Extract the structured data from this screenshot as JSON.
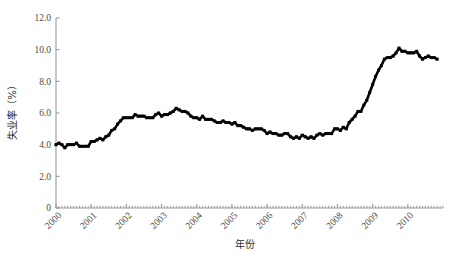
{
  "figure": {
    "background_color": "#ffffff",
    "axis_color": "#9a9a9a",
    "series_color": "#050505"
  },
  "chart_data": {
    "type": "line",
    "title": "",
    "subtitle": "",
    "xlabel": "年份",
    "ylabel": "失业率（%）",
    "ylim": [
      0.0,
      12.0
    ],
    "xlim": [
      2000.0,
      2011.0
    ],
    "yticks": [
      0,
      2.0,
      4.0,
      6.0,
      8.0,
      10.0,
      12.0
    ],
    "ytick_labels": [
      "0",
      "2.0",
      "4.0",
      "6.0",
      "8.0",
      "10.0",
      "12.0"
    ],
    "xticks": [
      2000,
      2001,
      2002,
      2003,
      2004,
      2005,
      2006,
      2007,
      2008,
      2009,
      2010
    ],
    "xtick_labels": [
      "2000",
      "2001",
      "2002",
      "2003",
      "2004",
      "2005",
      "2006",
      "2007",
      "2008",
      "2009",
      "2010"
    ],
    "xtick_label_rotation": 45,
    "minor_ticks": true,
    "minor_tick_interval_months": 1,
    "grid": false,
    "legend": false,
    "legend_position": "none",
    "marker": "filled-square",
    "x_unit": "month",
    "series": [
      {
        "name": "失业率",
        "x": [
          2000.0,
          2000.083,
          2000.167,
          2000.25,
          2000.333,
          2000.417,
          2000.5,
          2000.583,
          2000.667,
          2000.75,
          2000.833,
          2000.917,
          2001.0,
          2001.083,
          2001.167,
          2001.25,
          2001.333,
          2001.417,
          2001.5,
          2001.583,
          2001.667,
          2001.75,
          2001.833,
          2001.917,
          2002.0,
          2002.083,
          2002.167,
          2002.25,
          2002.333,
          2002.417,
          2002.5,
          2002.583,
          2002.667,
          2002.75,
          2002.833,
          2002.917,
          2003.0,
          2003.083,
          2003.167,
          2003.25,
          2003.333,
          2003.417,
          2003.5,
          2003.583,
          2003.667,
          2003.75,
          2003.833,
          2003.917,
          2004.0,
          2004.083,
          2004.167,
          2004.25,
          2004.333,
          2004.417,
          2004.5,
          2004.583,
          2004.667,
          2004.75,
          2004.833,
          2004.917,
          2005.0,
          2005.083,
          2005.167,
          2005.25,
          2005.333,
          2005.417,
          2005.5,
          2005.583,
          2005.667,
          2005.75,
          2005.833,
          2005.917,
          2006.0,
          2006.083,
          2006.167,
          2006.25,
          2006.333,
          2006.417,
          2006.5,
          2006.583,
          2006.667,
          2006.75,
          2006.833,
          2006.917,
          2007.0,
          2007.083,
          2007.167,
          2007.25,
          2007.333,
          2007.417,
          2007.5,
          2007.583,
          2007.667,
          2007.75,
          2007.833,
          2007.917,
          2008.0,
          2008.083,
          2008.167,
          2008.25,
          2008.333,
          2008.417,
          2008.5,
          2008.583,
          2008.667,
          2008.75,
          2008.833,
          2008.917,
          2009.0,
          2009.083,
          2009.167,
          2009.25,
          2009.333,
          2009.417,
          2009.5,
          2009.583,
          2009.667,
          2009.75,
          2009.833,
          2009.917,
          2010.0,
          2010.083,
          2010.167,
          2010.25,
          2010.333,
          2010.417,
          2010.5,
          2010.583,
          2010.667,
          2010.75,
          2010.833
        ],
        "values": [
          4.0,
          4.1,
          4.0,
          3.8,
          4.0,
          4.0,
          4.0,
          4.1,
          3.9,
          3.9,
          3.9,
          3.9,
          4.2,
          4.2,
          4.3,
          4.4,
          4.3,
          4.5,
          4.6,
          4.9,
          5.0,
          5.3,
          5.5,
          5.7,
          5.7,
          5.7,
          5.7,
          5.9,
          5.8,
          5.8,
          5.8,
          5.7,
          5.7,
          5.7,
          5.9,
          6.0,
          5.8,
          5.9,
          5.9,
          6.0,
          6.1,
          6.3,
          6.2,
          6.1,
          6.1,
          6.0,
          5.8,
          5.7,
          5.7,
          5.6,
          5.8,
          5.6,
          5.6,
          5.6,
          5.5,
          5.4,
          5.4,
          5.5,
          5.4,
          5.4,
          5.3,
          5.4,
          5.2,
          5.2,
          5.1,
          5.0,
          5.0,
          4.9,
          5.0,
          5.0,
          5.0,
          4.9,
          4.7,
          4.8,
          4.7,
          4.7,
          4.6,
          4.6,
          4.7,
          4.7,
          4.5,
          4.4,
          4.5,
          4.4,
          4.6,
          4.5,
          4.4,
          4.5,
          4.4,
          4.6,
          4.7,
          4.6,
          4.7,
          4.7,
          4.7,
          5.0,
          5.0,
          4.9,
          5.1,
          5.0,
          5.4,
          5.6,
          5.8,
          6.1,
          6.1,
          6.5,
          6.8,
          7.3,
          7.8,
          8.3,
          8.7,
          9.0,
          9.4,
          9.5,
          9.5,
          9.6,
          9.8,
          10.1,
          9.9,
          9.9,
          9.8,
          9.8,
          9.8,
          9.9,
          9.6,
          9.4,
          9.5,
          9.6,
          9.5,
          9.5,
          9.4
        ]
      }
    ]
  }
}
